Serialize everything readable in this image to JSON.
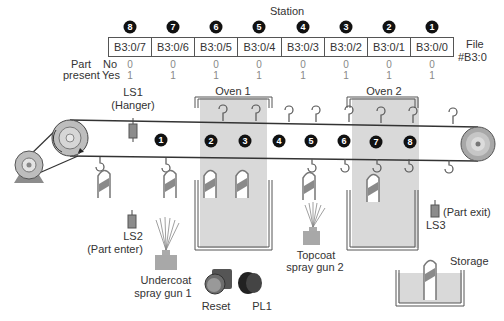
{
  "diagram": {
    "station_header": "Station",
    "file_label_line1": "File",
    "file_label_line2": "#B3:0",
    "part_present_label_line1": "Part",
    "part_present_label_line2": "present",
    "no_label": "No",
    "yes_label": "Yes",
    "stations": [
      {
        "number": "8",
        "address": "B3:0/7",
        "no": "0",
        "yes": "1"
      },
      {
        "number": "7",
        "address": "B3:0/6",
        "no": "0",
        "yes": "1"
      },
      {
        "number": "6",
        "address": "B3:0/5",
        "no": "0",
        "yes": "1"
      },
      {
        "number": "5",
        "address": "B3:0/4",
        "no": "0",
        "yes": "1"
      },
      {
        "number": "4",
        "address": "B3:0/3",
        "no": "0",
        "yes": "1"
      },
      {
        "number": "3",
        "address": "B3:0/2",
        "no": "0",
        "yes": "1"
      },
      {
        "number": "2",
        "address": "B3:0/1",
        "no": "0",
        "yes": "1"
      },
      {
        "number": "1",
        "address": "B3:0/0",
        "no": "0",
        "yes": "1"
      }
    ],
    "conveyor_station_markers": [
      "1",
      "2",
      "3",
      "4",
      "5",
      "6",
      "7",
      "8"
    ],
    "labels": {
      "ls1": "LS1",
      "ls1_sub": "(Hanger)",
      "oven1": "Oven 1",
      "oven2": "Oven 2",
      "ls2": "LS2",
      "ls2_sub": "(Part enter)",
      "ls3": "LS3",
      "ls3_sub": "(Part exit)",
      "spray_gun_1_line1": "Undercoat",
      "spray_gun_1_line2": "spray gun 1",
      "spray_gun_2_line1": "Topcoat",
      "spray_gun_2_line2": "spray gun 2",
      "reset": "Reset",
      "pl1": "PL1",
      "storage": "Storage"
    },
    "colors": {
      "oven_fill": "#d9d9d9",
      "part_stripe": "#8a8a8a",
      "sensor": "#8c8c8c",
      "badge": "#111111"
    }
  }
}
